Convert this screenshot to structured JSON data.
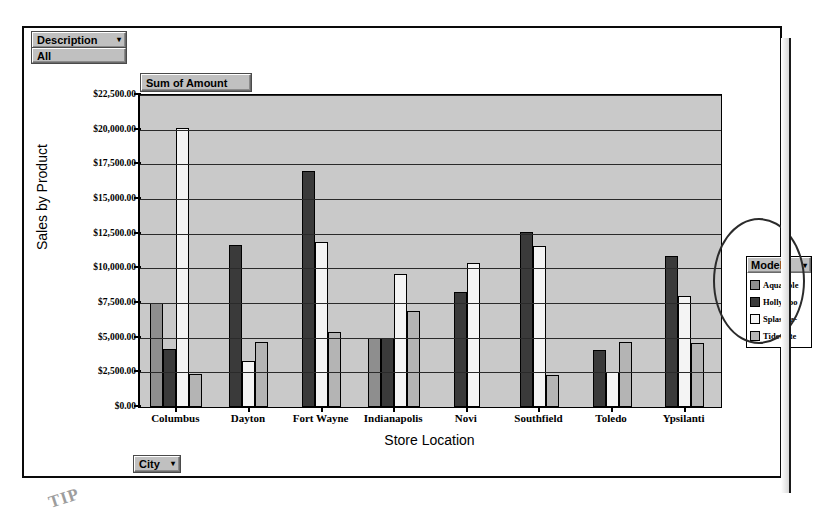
{
  "report": {
    "page_field": {
      "label": "Description",
      "caret": "▾",
      "value": "All"
    },
    "chart_title": "Sum of Amount",
    "category_field_button": {
      "label": "City",
      "caret": "▾"
    },
    "scan_artifact_text": "TIP"
  },
  "legend": {
    "button_label": "Model",
    "caret": "▾",
    "items": [
      {
        "label": "AquaSple",
        "swatch": "#8e8e8e"
      },
      {
        "label": "Hollywoo",
        "swatch": "#3a3a3a"
      },
      {
        "label": "Splash-a-",
        "swatch": "#f4f4f4"
      },
      {
        "label": "Tidewate",
        "swatch": "#b4b4b4"
      }
    ]
  },
  "chart_data": {
    "type": "bar",
    "title": "Sum of Amount",
    "xlabel": "Store Location",
    "ylabel": "Sales by Product",
    "ylim": [
      0,
      22500
    ],
    "ytick_step": 2500,
    "grid": true,
    "legend_position": "right",
    "ytick_labels": [
      "$22,500.00",
      "$20,000.00",
      "$17,500.00",
      "$15,000.00",
      "$12,500.00",
      "$10,000.00",
      "$7,500.00",
      "$5,000.00",
      "$2,500.00",
      "$0.00"
    ],
    "categories": [
      "Columbus",
      "Dayton",
      "Fort Wayne",
      "Indianapolis",
      "Novi",
      "Southfield",
      "Toledo",
      "Ypsilanti"
    ],
    "series": [
      {
        "name": "AquaSple",
        "color": "#8e8e8e",
        "values": [
          7500,
          0,
          0,
          5000,
          0,
          0,
          0,
          0
        ]
      },
      {
        "name": "Hollywoo",
        "color": "#3a3a3a",
        "values": [
          4200,
          11700,
          17000,
          5000,
          8300,
          12600,
          4100,
          10900
        ]
      },
      {
        "name": "Splash-a-",
        "color": "#f4f4f4",
        "values": [
          20100,
          3300,
          11900,
          9600,
          10400,
          11600,
          2500,
          8000
        ]
      },
      {
        "name": "Tidewate",
        "color": "#b4b4b4",
        "values": [
          2350,
          4700,
          5400,
          6900,
          0,
          2300,
          4700,
          4600
        ]
      }
    ]
  }
}
